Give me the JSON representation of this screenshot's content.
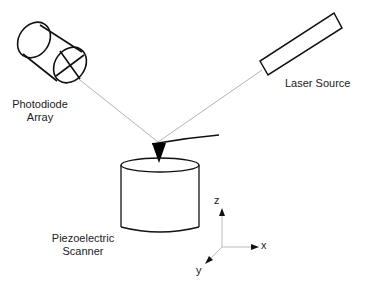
{
  "diagram": {
    "labels": {
      "photodiode_line1": "Photodiode",
      "photodiode_line2": "Array",
      "laser": "Laser Source",
      "scanner_line1": "Piezoelectric",
      "scanner_line2": "Scanner",
      "axis_z": "z",
      "axis_x": "x",
      "axis_y": "y"
    },
    "colors": {
      "stroke": "#111111",
      "beam": "#9a9a9a",
      "axis": "#bbbbbb",
      "text": "#222222"
    }
  }
}
